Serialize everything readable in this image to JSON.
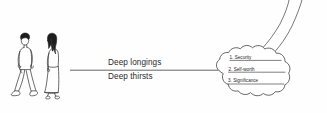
{
  "diagram": {
    "background_color": "#fefefe",
    "ink_color": "#3a3a3a",
    "text_color": "#2a2a2a",
    "figures": {
      "name": "two-walking-people",
      "person_left": "man-walking",
      "person_right": "woman-walking"
    },
    "connector": {
      "name": "horizontal-connector-line"
    },
    "labels": [
      {
        "id": "deep-longings",
        "text": "Deep longings"
      },
      {
        "id": "deep-thirsts",
        "text": "Deep thirsts"
      }
    ],
    "cloud": {
      "name": "thought-cloud",
      "swooshes": 2,
      "items": [
        {
          "number": "1.",
          "text": "1. Security"
        },
        {
          "number": "2.",
          "text": "2. Self-worth"
        },
        {
          "number": "3.",
          "text": "3. Significance"
        }
      ]
    }
  }
}
